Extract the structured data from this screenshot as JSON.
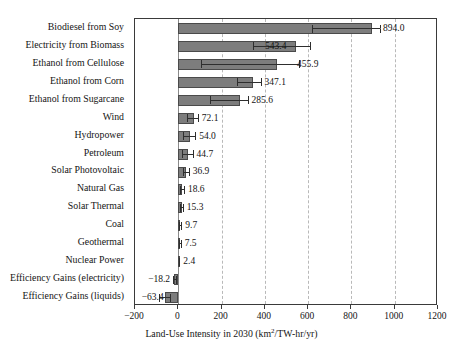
{
  "chart_data": {
    "type": "bar",
    "orientation": "horizontal",
    "title": "",
    "xlabel": "Land-Use Intensity in 2030 (km2/TW-hr/yr)",
    "xlabel_parts": {
      "before": "Land-Use Intensity in 2030 (km",
      "superscript": "2",
      "after": "/TW-hr/yr)"
    },
    "ylabel": "",
    "xlim": [
      -200,
      1200
    ],
    "xticks": [
      -200,
      0,
      200,
      400,
      600,
      800,
      1000,
      1200
    ],
    "xtick_labels": [
      "−200",
      "0",
      "200",
      "400",
      "600",
      "800",
      "1000",
      "1200"
    ],
    "grid": "vertical-dashed",
    "legend": "none",
    "bar_color": "#7d7d7d",
    "bar_edge_color": "#4a4a4a",
    "grid_color": "#b9b9b9",
    "axis_color": "#3a3a3a",
    "categories": [
      "Biodiesel from Soy",
      "Electricity from Biomass",
      "Ethanol from Cellulose",
      "Ethanol from Corn",
      "Ethanol from Sugarcane",
      "Wind",
      "Hydropower",
      "Petroleum",
      "Solar Photovoltaic",
      "Natural Gas",
      "Solar Thermal",
      "Coal",
      "Geothermal",
      "Nuclear Power",
      "Efficiency Gains (electricity)",
      "Efficiency Gains (liquids)"
    ],
    "values": [
      894.0,
      543.4,
      455.9,
      347.1,
      285.6,
      72.1,
      54.0,
      44.7,
      36.9,
      18.6,
      15.3,
      9.7,
      7.5,
      2.4,
      -18.2,
      -63.4
    ],
    "value_labels": [
      "894.0",
      "543.4",
      "455.9",
      "347.1",
      "285.6",
      "72.1",
      "54.0",
      "44.7",
      "36.9",
      "18.6",
      "15.3",
      "9.7",
      "7.5",
      "2.4",
      "−18.2",
      "−63.4"
    ],
    "error_low": [
      620,
      345,
      105,
      270,
      145,
      40,
      22,
      18,
      22,
      10,
      8,
      5,
      4,
      1,
      -26,
      -90
    ],
    "error_high": [
      930,
      610,
      560,
      380,
      320,
      90,
      78,
      66,
      48,
      26,
      21,
      14,
      11,
      5,
      -10,
      -40
    ],
    "label_placement": [
      "leader",
      "leader",
      "leader",
      "right",
      "right",
      "right",
      "right",
      "right",
      "right",
      "right",
      "right",
      "right",
      "right",
      "right",
      "left",
      "left"
    ]
  }
}
